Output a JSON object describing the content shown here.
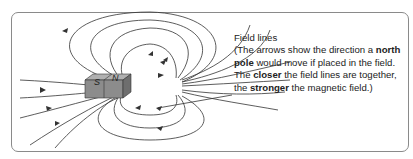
{
  "magnet": {
    "south_label": "S",
    "north_label": "N"
  },
  "annotation": {
    "title": "Field lines",
    "line1": "(The arrows show the direction a",
    "bold1": "north pole",
    "line2": " would move if placed in the field. The ",
    "bold2": "closer",
    "line3": " the field lines are together, the ",
    "bold3": "stronger",
    "line4": " the magnetic field.)"
  },
  "colors": {
    "line": "#333333",
    "magnet_top": "#b0b0b0",
    "magnet_front": "#8c8c8c",
    "magnet_side": "#6e6e6e",
    "frame": "#8a8a8a"
  }
}
